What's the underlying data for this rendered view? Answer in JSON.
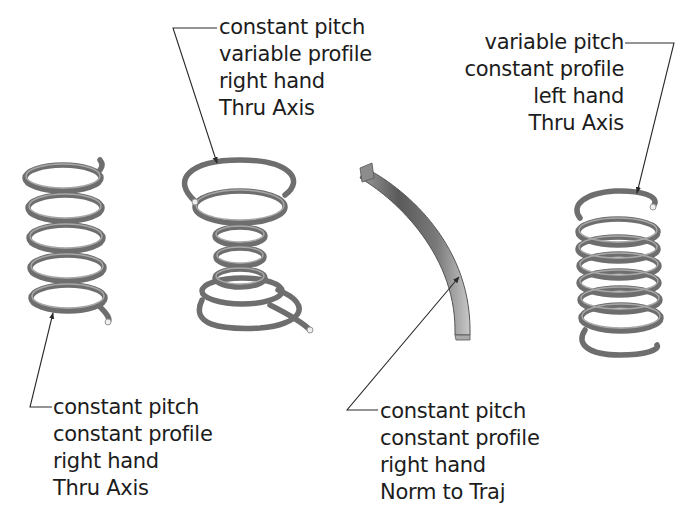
{
  "diagram": {
    "type": "helical sweep examples",
    "callouts": [
      {
        "id": "spring-1",
        "lines": [
          "constant pitch",
          "constant profile",
          "right hand",
          "Thru Axis"
        ]
      },
      {
        "id": "spring-2",
        "lines": [
          "constant pitch",
          "variable profile",
          "right hand",
          "Thru Axis"
        ]
      },
      {
        "id": "spring-3",
        "lines": [
          "constant pitch",
          "constant profile",
          "right hand",
          "Norm to Traj"
        ]
      },
      {
        "id": "spring-4",
        "lines": [
          "variable pitch",
          "constant profile",
          "left hand",
          "Thru Axis"
        ]
      }
    ],
    "colors": {
      "coil": "#6e6e6e",
      "coil_highlight": "#a8a8a8",
      "leader": "#2a2a2a",
      "text": "#1c1c1c",
      "background": "#ffffff"
    }
  }
}
